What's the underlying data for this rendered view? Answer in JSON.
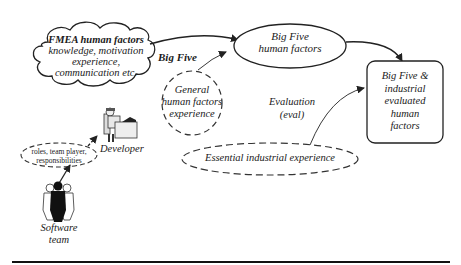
{
  "diagram": {
    "cloud": {
      "title": "FMEA human factors",
      "line1": "knowledge, motivation",
      "line2": "experience,",
      "line3": "communication etc."
    },
    "big_five_label": "Big Five",
    "big_five_ellipse": {
      "line1": "Big Five",
      "line2": "human factors"
    },
    "general_ellipse": {
      "line1": "General",
      "line2": "human factors",
      "line3": "experience"
    },
    "result_box": {
      "line1": "Big Five &",
      "line2": "industrial",
      "line3": "evaluated",
      "line4": "human",
      "line5": "factors"
    },
    "evaluation_label": {
      "line1": "Evaluation",
      "line2": "(eval)"
    },
    "essential_ellipse": "Essential industrial experience",
    "roles_ellipse": {
      "line1": "roles, team player,",
      "line2": "responsibilities"
    },
    "developer_label": "Developer",
    "software_team_label": {
      "line1": "Software",
      "line2": "team"
    }
  }
}
